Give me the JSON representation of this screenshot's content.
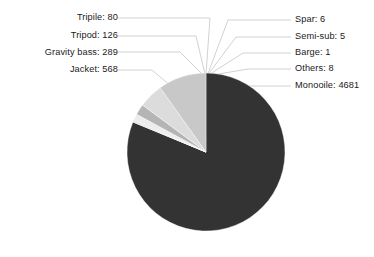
{
  "chart_data": {
    "type": "pie",
    "title": "",
    "subtitle": "",
    "xlabel": "",
    "ylabel": "",
    "legend_position": "callout-labels",
    "grid": false,
    "total": 5764,
    "categories": [
      "Monooile",
      "Jacket",
      "Gravity bass",
      "Tripod",
      "Tripile",
      "Others",
      "Spar",
      "Semi-sub",
      "Barge"
    ],
    "values": [
      4681,
      568,
      289,
      126,
      80,
      8,
      6,
      5,
      1
    ],
    "slices": [
      {
        "name": "Monooile",
        "value": 4681,
        "label": "Monooile: 4681",
        "color": "#333333",
        "side": "right"
      },
      {
        "name": "Barge",
        "value": 1,
        "label": "Barge: 1",
        "color": "#dedede",
        "side": "right"
      },
      {
        "name": "Semi-sub",
        "value": 5,
        "label": "Semi-sub: 5",
        "color": "#8f8f8f",
        "side": "right"
      },
      {
        "name": "Spar",
        "value": 6,
        "label": "Spar: 6",
        "color": "#cfcfcf",
        "side": "right"
      },
      {
        "name": "Others",
        "value": 8,
        "label": "Others: 8",
        "color": "#a8a8a8",
        "side": "right"
      },
      {
        "name": "Tripile",
        "value": 80,
        "label": "Tripile: 80",
        "color": "#ededed",
        "side": "left"
      },
      {
        "name": "Tripod",
        "value": 126,
        "label": "Tripod: 126",
        "color": "#b5b5b5",
        "side": "left"
      },
      {
        "name": "Gravity bass",
        "value": 289,
        "label": "Gravity bass: 289",
        "color": "#dcdcdc",
        "side": "left"
      },
      {
        "name": "Jacket",
        "value": 568,
        "label": "Jacket: 568",
        "color": "#c8c8c8",
        "side": "left"
      }
    ]
  },
  "labels": {
    "left": [
      {
        "text": "Tripile: 80"
      },
      {
        "text": "Tripod: 126"
      },
      {
        "text": "Gravity bass: 289"
      },
      {
        "text": "Jacket: 568"
      }
    ],
    "right": [
      {
        "text": "Spar: 6"
      },
      {
        "text": "Semi-sub: 5"
      },
      {
        "text": "Barge: 1"
      },
      {
        "text": "Others: 8"
      },
      {
        "text": "Monooile: 4681"
      }
    ]
  },
  "colors": {
    "background": "#ffffff",
    "text": "#1a1a1a",
    "leader_line": "#cccccc",
    "dominant_slice": "#333333",
    "secondary_slice": "#c8c8c8"
  }
}
